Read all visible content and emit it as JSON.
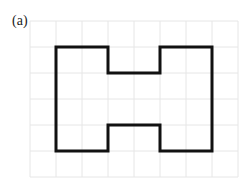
{
  "figure": {
    "label": "(a)",
    "grid": {
      "columns": 8,
      "rows": 6,
      "cell_size_px": 26,
      "origin_px": [
        30,
        21
      ],
      "line_color": "#e6e6e6"
    },
    "shape": {
      "name": "H-shaped polygon",
      "stroke_color": "#111111",
      "stroke_width": 3,
      "vertices_grid": [
        [
          1,
          1
        ],
        [
          3,
          1
        ],
        [
          3,
          2
        ],
        [
          5,
          2
        ],
        [
          5,
          1
        ],
        [
          7,
          1
        ],
        [
          7,
          5
        ],
        [
          5,
          5
        ],
        [
          5,
          4
        ],
        [
          3,
          4
        ],
        [
          3,
          5
        ],
        [
          1,
          5
        ]
      ]
    }
  }
}
